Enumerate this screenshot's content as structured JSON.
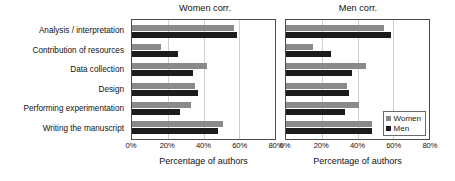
{
  "chart_data": [
    {
      "type": "bar",
      "orientation": "horizontal",
      "title": "Women corr.",
      "xlabel": "Percentage of authors",
      "ylabel": "",
      "xlim": [
        0,
        80
      ],
      "xticks": [
        0,
        20,
        40,
        60,
        80
      ],
      "xtick_labels": [
        "0%",
        "20%",
        "40%",
        "60%",
        "80%"
      ],
      "grid": true,
      "legend_position": "none",
      "categories": [
        "Analysis / interpretation",
        "Contribution of resources",
        "Data collection",
        "Design",
        "Performing experimentation",
        "Writing the manuscript"
      ],
      "series": [
        {
          "name": "Women",
          "color": "#8a8a8a",
          "values": [
            57,
            16,
            42,
            35,
            33,
            51
          ]
        },
        {
          "name": "Men",
          "color": "#1c1c1c",
          "values": [
            59,
            26,
            34,
            37,
            27,
            48
          ]
        }
      ]
    },
    {
      "type": "bar",
      "orientation": "horizontal",
      "title": "Men corr.",
      "xlabel": "Percentage of authors",
      "ylabel": "",
      "xlim": [
        0,
        80
      ],
      "xticks": [
        0,
        20,
        40,
        60,
        80
      ],
      "xtick_labels": [
        "0%",
        "20%",
        "40%",
        "60%",
        "80%"
      ],
      "grid": true,
      "legend_position": "inside-lower-right",
      "categories": [
        "Analysis / interpretation",
        "Contribution of resources",
        "Data collection",
        "Design",
        "Performing experimentation",
        "Writing the manuscript"
      ],
      "series": [
        {
          "name": "Women",
          "color": "#8a8a8a",
          "values": [
            55,
            15,
            45,
            34,
            41,
            48
          ]
        },
        {
          "name": "Men",
          "color": "#1c1c1c",
          "values": [
            59,
            25,
            37,
            35,
            33,
            48
          ]
        }
      ]
    }
  ],
  "legend": {
    "entries": [
      {
        "label": "Women",
        "color": "#8a8a8a"
      },
      {
        "label": "Men",
        "color": "#1c1c1c"
      }
    ]
  }
}
